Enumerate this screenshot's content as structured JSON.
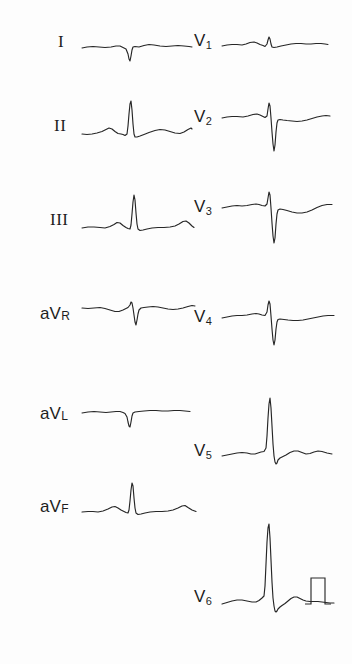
{
  "document": {
    "kind": "12-lead electrocardiogram",
    "background_color": "#fdfdfd",
    "trace_color": "#262626",
    "label_color": "#1d1d1d",
    "width": 352,
    "height": 664
  },
  "leads": {
    "I": {
      "label": "I",
      "label_style": "roman"
    },
    "II": {
      "label": "II",
      "label_style": "roman"
    },
    "III": {
      "label": "III",
      "label_style": "roman"
    },
    "aVR": {
      "prefix": "aV",
      "suffix": "R",
      "label_style": "avlead"
    },
    "aVL": {
      "prefix": "aV",
      "suffix": "L",
      "label_style": "avlead"
    },
    "aVF": {
      "prefix": "aV",
      "suffix": "F",
      "label_style": "avlead"
    },
    "V1": {
      "prefix": "V",
      "suffix": "1",
      "label_style": "vlead"
    },
    "V2": {
      "prefix": "V",
      "suffix": "2",
      "label_style": "vlead"
    },
    "V3": {
      "prefix": "V",
      "suffix": "3",
      "label_style": "vlead"
    },
    "V4": {
      "prefix": "V",
      "suffix": "4",
      "label_style": "vlead"
    },
    "V5": {
      "prefix": "V",
      "suffix": "5",
      "label_style": "vlead"
    },
    "V6": {
      "prefix": "V",
      "suffix": "6",
      "label_style": "vlead"
    }
  },
  "calibration": {
    "present": true,
    "shape": "rectangular-standardization-pulse"
  },
  "chart_data": {
    "type": "line",
    "title": "",
    "xlabel": "",
    "ylabel": "",
    "grid": false,
    "legend": "none",
    "columns": {
      "left": [
        "I",
        "II",
        "III",
        "aVR",
        "aVL",
        "aVF"
      ],
      "right": [
        "V1",
        "V2",
        "V3",
        "V4",
        "V5",
        "V6"
      ]
    },
    "series": [
      {
        "name": "I",
        "column": "left",
        "trace_width": 110,
        "points": "0,0 5,-1 11,-1.5 17,-1 23,-0.5 29,-1 34,-2 38,-2 41,-0.5 44,1 46,6 47,11 48,13 49,8 50,2 51,-1 53,-1.5 57,-1 62,-2.5 67,-3.5 72,-3 78,-2 84,-1.5 90,-2 96,-2.5 102,-2 107,-1.5 110,-1"
      },
      {
        "name": "II",
        "column": "left",
        "trace_width": 110,
        "points": "0,0 5,0.5 10,0 15,-1 20,-2.5 24,-4.5 27,-6 30,-5 33,-2.5 36,-0.5 39,0 41,0.5 43,1.5 45,0 46,-8 47,-20 48,-30 49,-33 50,-24 51,-10 52,0 53,3 55,3 58,2 62,0.5 67,-1.5 73,-3.5 78,-4.5 83,-4 88,-2.5 93,-1 98,-0.5 102,-2 106,-4.5 109,-6 110,-5"
      },
      {
        "name": "III",
        "column": "left",
        "trace_width": 112,
        "points": "0,0 6,-1 12,-1 18,-0.5 23,0 28,-1.5 32,-3.5 35,-5.5 38,-5 41,-2.5 44,-0.5 46,0.5 48,1 49,-3 50,-14 51,-26 52,-33 53,-28 54,-15 55,-4 56,1 58,2.5 61,2 65,1 70,0 76,-0.5 82,-0.5 88,-1 93,-2 97,-4 101,-6.5 104,-7 107,-5 110,-2 112,-0.5"
      },
      {
        "name": "aVR",
        "column": "left",
        "trace_width": 113,
        "points": "0,0 6,0.5 12,0 18,-0.5 23,0.5 28,2 33,3.5 37,3.5 41,2 44,0.5 46,-0.5 48,-3 49,-6 50,-5 51,0 52,7 53,14 54,17 55,12 56,6 57,2 59,0 62,-0.5 66,-1 71,-1.5 76,-1 81,0 86,1 91,1.5 96,1 101,0 106,-1.5 110,-2.5 113,-2"
      },
      {
        "name": "aVL",
        "column": "left",
        "trace_width": 108,
        "points": "0,0 6,-1 12,-1.5 18,-1 24,-0.5 29,-1 34,-1.5 38,-1.5 41,-0.5 43,0.5 45,4 46,9 47,13 48,14 49,9 50,3 51,0 53,-1 57,-1.5 62,-2 68,-2.5 74,-2.5 80,-2 86,-2 92,-2.5 98,-2.5 103,-2 108,-1.5"
      },
      {
        "name": "aVF",
        "column": "left",
        "trace_width": 114,
        "points": "0,0 6,-0.5 11,-0.5 16,0 21,-1 26,-3 30,-5 33,-5.5 36,-4 39,-2 42,-0.5 44,0.5 46,1 47,-2 48,-11 49,-22 50,-29 51,-26 52,-14 53,-4 54,1 56,2.5 59,2 63,1 68,0 74,-0.5 80,-0.5 86,-1 91,-2 96,-4 100,-6 103,-6.5 106,-4.5 110,-2 114,-0.5"
      },
      {
        "name": "V1",
        "column": "right",
        "trace_width": 106,
        "points": "0,0 5,-1 10,-1.5 15,-1.5 20,-1 24,-2 28,-3.5 32,-4 35,-3 38,-1.5 41,-0.5 43,0.5 45,-2 46,-6 47,-9 48,-7 49,-2 50,1 52,1.5 55,1 59,0 64,-1 69,-2 74,-2.5 79,-2.5 84,-2 89,-2 94,-2.5 99,-2.5 103,-2 106,-1.5"
      },
      {
        "name": "V2",
        "column": "right",
        "trace_width": 108,
        "points": "0,0 5,-1 10,-1.5 15,-1.5 21,-1 26,-2 31,-3.5 35,-4 38,-3 41,-1.5 43,-0.5 45,-2 46,-9 47,-15 48,-12 49,0 50,14 51,26 52,33 53,27 54,14 55,5 56,2 58,1.5 61,2 65,2.5 70,3 75,3.5 80,3 85,2 90,0.5 95,-1 100,-2 104,-2.5 108,-2"
      },
      {
        "name": "V3",
        "column": "right",
        "trace_width": 110,
        "points": "0,0 5,-1 10,-2 15,-2.5 20,-2 25,-2.5 30,-3.5 34,-4 37,-3.5 40,-2.5 43,-2 45,-4 46,-10 47,-16 48,-13 49,0 50,15 51,28 52,35 53,30 54,16 55,6 56,2 58,1 61,1.5 65,2.5 70,4 75,5 80,5 85,4 90,2 95,-0.5 100,-2.5 105,-3.5 110,-3.5"
      },
      {
        "name": "V4",
        "column": "right",
        "trace_width": 112,
        "points": "0,0 5,-1 10,-2 15,-2.5 20,-2.5 25,-3 30,-4 34,-4.5 37,-4 40,-3 43,-2.5 45,-6 46,-13 47,-17 48,-14 49,-2 50,11 51,22 52,27 53,22 54,11 55,4 56,1.5 58,1 62,1.5 66,2 71,2.5 76,2.5 81,2 86,1 91,0 96,-1 101,-2 106,-2.5 112,-2.5"
      },
      {
        "name": "V5",
        "column": "right",
        "trace_width": 110,
        "points": "0,0 5,-1 10,-2 15,-3 20,-3.5 25,-3 29,-2 33,-2 36,-3 39,-4 42,-4.5 44,-8 45,-20 46,-38 47,-52 48,-58 49,-48 50,-30 51,-12 52,0 53,6 54,8 55,7 56,4 58,2 61,0.5 64,-1 68,-3.5 72,-5 76,-5 80,-3.5 84,-2 88,-2.5 92,-4 96,-5 100,-4.5 105,-3 110,-2"
      },
      {
        "name": "V6",
        "column": "right",
        "trace_width": 112,
        "points": "0,0 5,-1.5 10,-3 15,-4 20,-4 25,-3 30,-2 34,-2 37,-3.5 40,-6 42,-8 43,-18 44,-40 45,-62 46,-76 47,-80 48,-66 49,-44 50,-22 51,-6 52,2 53,7 54,8 55,7 56,5 58,3 60,1.5 63,-0.5 66,-3 69,-5.5 72,-7 75,-7 78,-5.5 81,-4 84,-3 88,-2.5 92,-2.5 96,-2.5 100,-2 104,-1.5 108,-1 112,-1"
      }
    ],
    "calibration_pulse": {
      "points": "0,0 6,0 6,-26 20,-26 20,0 26,0",
      "note": "standardization rectangle to the right of the V6 tracing"
    }
  }
}
